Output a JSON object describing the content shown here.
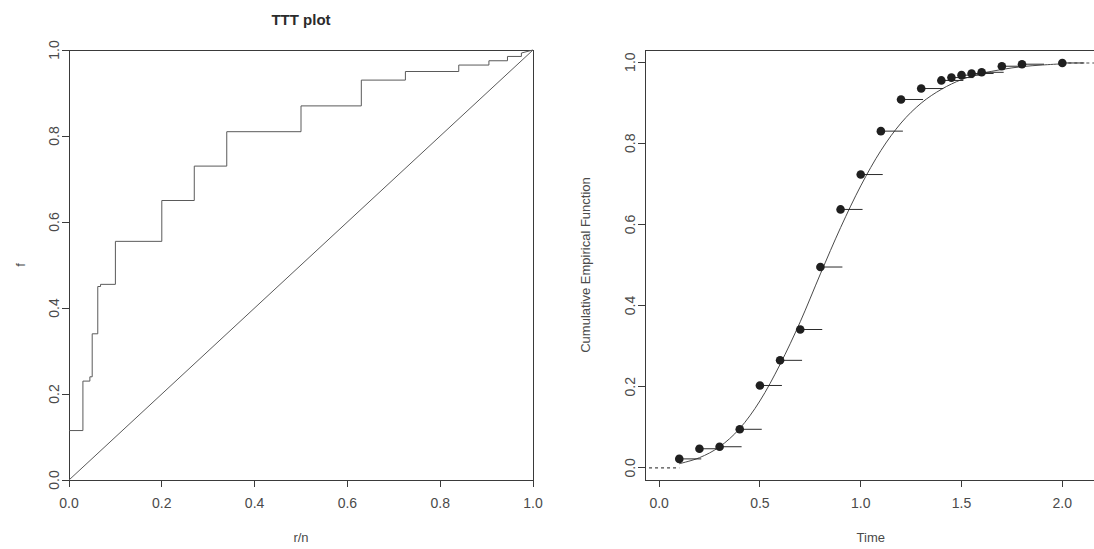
{
  "figure": {
    "background_color": "#ffffff",
    "foreground_color": "#3a3a3a",
    "width": 1094,
    "height": 549,
    "panel_count": 2
  },
  "chart_data": [
    {
      "type": "line",
      "id": "ttt-plot",
      "title": "TTT plot",
      "xlabel": "r/n",
      "ylabel": "f",
      "xlim": [
        0.0,
        1.0
      ],
      "ylim": [
        0.0,
        1.0
      ],
      "grid": false,
      "legend": "none",
      "xticks": [
        "0.0",
        "0.2",
        "0.4",
        "0.6",
        "0.8",
        "1.0"
      ],
      "xtick_values": [
        0.0,
        0.2,
        0.4,
        0.6,
        0.8,
        1.0
      ],
      "yticks": [
        "0.0",
        "0.2",
        "0.4",
        "0.6",
        "0.8",
        "1.0"
      ],
      "ytick_values": [
        0.0,
        0.2,
        0.4,
        0.6,
        0.8,
        1.0
      ],
      "series": [
        {
          "name": "scaled TTT step function",
          "style": "step",
          "x": [
            0.0,
            0.03,
            0.03,
            0.045,
            0.045,
            0.05,
            0.05,
            0.062,
            0.062,
            0.068,
            0.068,
            0.1,
            0.1,
            0.2,
            0.2,
            0.27,
            0.27,
            0.34,
            0.34,
            0.5,
            0.5,
            0.63,
            0.63,
            0.725,
            0.725,
            0.84,
            0.84,
            0.905,
            0.905,
            0.945,
            0.945,
            0.975,
            0.975,
            1.0
          ],
          "y": [
            0.115,
            0.115,
            0.23,
            0.23,
            0.24,
            0.24,
            0.34,
            0.34,
            0.45,
            0.45,
            0.455,
            0.455,
            0.555,
            0.555,
            0.65,
            0.65,
            0.73,
            0.73,
            0.81,
            0.81,
            0.87,
            0.87,
            0.93,
            0.93,
            0.95,
            0.95,
            0.965,
            0.965,
            0.975,
            0.975,
            0.985,
            0.985,
            0.993,
            1.0
          ]
        },
        {
          "name": "diagonal reference line",
          "style": "straight",
          "x": [
            0.0,
            1.0
          ],
          "y": [
            0.0,
            1.0
          ]
        }
      ]
    },
    {
      "type": "line",
      "id": "cumulative-empirical-function-plot",
      "title": "",
      "xlabel": "Time",
      "ylabel": "Cumulative Empirical Function",
      "xlim": [
        -0.07,
        2.42
      ],
      "ylim": [
        -0.03,
        1.03
      ],
      "grid": false,
      "legend": "none",
      "xticks": [
        "0.0",
        "0.5",
        "1.0",
        "1.5",
        "2.0"
      ],
      "xtick_values": [
        0.0,
        0.5,
        1.0,
        1.5,
        2.0
      ],
      "yticks": [
        "0.0",
        "0.2",
        "0.4",
        "0.6",
        "0.8",
        "1.0"
      ],
      "ytick_values": [
        0.0,
        0.2,
        0.4,
        0.6,
        0.8,
        1.0
      ],
      "series": [
        {
          "name": "empirical points",
          "style": "points-with-right-whisker",
          "x": [
            0.1,
            0.2,
            0.3,
            0.4,
            0.5,
            0.6,
            0.7,
            0.8,
            0.9,
            1.0,
            1.1,
            1.2,
            1.3,
            1.4,
            1.45,
            1.5,
            1.55,
            1.6,
            1.7,
            1.8,
            2.0
          ],
          "y": [
            0.022,
            0.047,
            0.052,
            0.095,
            0.203,
            0.265,
            0.341,
            0.495,
            0.637,
            0.723,
            0.83,
            0.908,
            0.935,
            0.955,
            0.962,
            0.968,
            0.972,
            0.975,
            0.99,
            0.995,
            0.998
          ]
        },
        {
          "name": "fitted cumulative distribution curve",
          "style": "smooth",
          "x": [
            0.1,
            0.2,
            0.3,
            0.4,
            0.5,
            0.6,
            0.7,
            0.8,
            0.9,
            1.0,
            1.1,
            1.2,
            1.3,
            1.4,
            1.5,
            1.6,
            1.7,
            1.8,
            1.9,
            2.0
          ],
          "y": [
            0.01,
            0.025,
            0.052,
            0.097,
            0.165,
            0.255,
            0.36,
            0.478,
            0.592,
            0.695,
            0.782,
            0.85,
            0.899,
            0.933,
            0.957,
            0.972,
            0.982,
            0.989,
            0.993,
            0.996
          ]
        },
        {
          "name": "left baseline dashed segment",
          "style": "dashed",
          "x": [
            -0.05,
            0.1
          ],
          "y": [
            0.0,
            0.0
          ]
        },
        {
          "name": "right plateau dashed segment",
          "style": "dashed",
          "x": [
            2.0,
            2.4
          ],
          "y": [
            0.998,
            0.998
          ]
        }
      ]
    }
  ]
}
